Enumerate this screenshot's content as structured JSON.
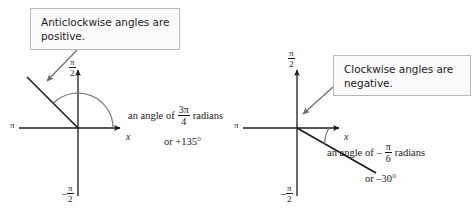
{
  "figure": {
    "background_color": "#ffffff",
    "line_color": "#1a1a1a",
    "arrow_color": "#6b6b77",
    "callout_border_color": "#b9b9b9",
    "callout_fill_color": "#fbfbfb"
  },
  "callouts": [
    {
      "id": "anticlockwise",
      "line1": "Anticlockwise angles are",
      "line2": "positive."
    },
    {
      "id": "clockwise",
      "line1": "Clockwise angles are",
      "line2": "negative."
    }
  ],
  "diagrams": [
    {
      "id": "positive-angle",
      "axis_labels": {
        "left": "π",
        "right": "x",
        "top_numerator": "π",
        "top_denominator": "2",
        "bottom_sign": "–",
        "bottom_numerator": "π",
        "bottom_denominator": "2"
      },
      "annotation": {
        "prefix": "an angle of",
        "numerator": "3π",
        "denominator": "4",
        "suffix": "radians",
        "degrees": "or +135°"
      },
      "angle_degrees": 135,
      "direction": "anticlockwise"
    },
    {
      "id": "negative-angle",
      "axis_labels": {
        "left": "π",
        "right": "x",
        "top_numerator": "π",
        "top_denominator": "2",
        "bottom_sign": "–",
        "bottom_numerator": "π",
        "bottom_denominator": "2"
      },
      "annotation": {
        "prefix": "an angle of",
        "sign": "–",
        "numerator": "π",
        "denominator": "6",
        "suffix": "radians",
        "degrees": "or –30°"
      },
      "angle_degrees": -30,
      "direction": "clockwise"
    }
  ]
}
